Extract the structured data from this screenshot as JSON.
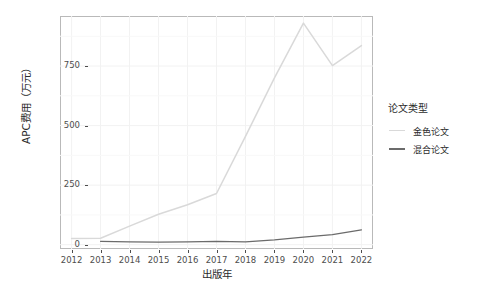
{
  "chart_data": {
    "type": "line",
    "title": "",
    "xlabel": "出版年",
    "ylabel": "APC费用（万元）",
    "x": [
      2012,
      2013,
      2014,
      2015,
      2016,
      2017,
      2018,
      2019,
      2020,
      2021,
      2022
    ],
    "xtick_labels": [
      "2012",
      "2013",
      "2014",
      "2015",
      "2016",
      "2017",
      "2018",
      "2019",
      "2020",
      "2021",
      "2022"
    ],
    "ytick_labels": [
      "0",
      "250",
      "500",
      "750"
    ],
    "yticks": [
      0,
      250,
      500,
      750
    ],
    "ylim": [
      -18,
      960
    ],
    "xlim": [
      2011.6,
      2022.4
    ],
    "grid": true,
    "legend_position": "right",
    "legend_title": "论文类型",
    "series": [
      {
        "name": "金色论文",
        "color": "#d9d9d9",
        "values": [
          26,
          27,
          78,
          128,
          168,
          215,
          455,
          700,
          930,
          752,
          836
        ]
      },
      {
        "name": "混合论文",
        "color": "#6b6b6b",
        "values": [
          null,
          14,
          12,
          11,
          12,
          14,
          12,
          20,
          32,
          42,
          62
        ]
      }
    ]
  },
  "legend": {
    "title": "论文类型",
    "items": [
      {
        "label": "金色论文",
        "color": "#d9d9d9"
      },
      {
        "label": "混合论文",
        "color": "#6b6b6b"
      }
    ]
  },
  "axes": {
    "y_title": "APC费用（万元）",
    "x_title": "出版年",
    "y_tick_labels": [
      "750",
      "500",
      "250",
      "0"
    ],
    "x_tick_labels": [
      "2012",
      "2013",
      "2014",
      "2015",
      "2016",
      "2017",
      "2018",
      "2019",
      "2020",
      "2021",
      "2022"
    ]
  },
  "colors": {
    "panel_background": "#ffffff",
    "panel_border": "#b9b9b9",
    "grid": "#f2f2f2",
    "axis_text": "#4d4d4d",
    "title_text": "#2b2b2b",
    "series_gold": "#d9d9d9",
    "series_hybrid": "#6b6b6b"
  }
}
